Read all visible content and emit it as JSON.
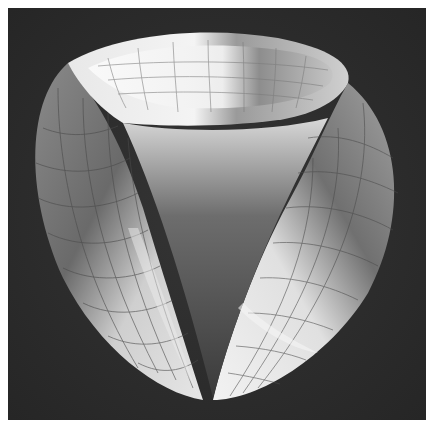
{
  "image": {
    "subject": "white plaster mathematical model of a three-lobed surface with grid lines",
    "background_color": "#2c2c2c",
    "border_color": "#ffffff",
    "surface_light": "#efefef",
    "surface_mid": "#b5b5b5",
    "surface_shadow": "#5a5a5a",
    "grid_line_color": "#6e6e6e"
  }
}
